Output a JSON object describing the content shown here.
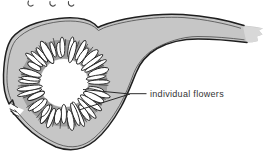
{
  "figure": {
    "annotation": {
      "label": "individual flowers"
    },
    "colors": {
      "background": "#ffffff",
      "wall_fill": "#c6c6c6",
      "outline": "#1f1f1f",
      "inner_line": "#4a4a4a",
      "torn_end": "#d8d8d8",
      "ring_shadow": "#9e9e9e",
      "cavity": "#ffffff",
      "flower_fill": "#ffffff",
      "flower_stroke": "#242424",
      "leader_line": "#2a2a2a",
      "label_color": "#333333"
    },
    "flower_ring": {
      "cx": 64,
      "cy": 83,
      "inner_r": 24,
      "outer_r": 44,
      "count": 40,
      "seed": 13
    }
  }
}
